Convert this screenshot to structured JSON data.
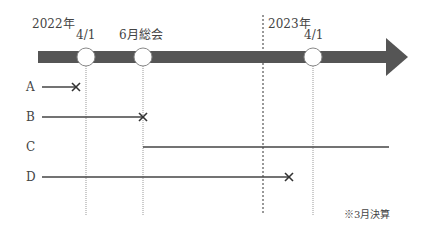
{
  "timeline": {
    "year_start_label": "2022年",
    "year_end_label": "2023年",
    "markers": [
      {
        "label": "4/1",
        "x": 86
      },
      {
        "label": "6月総会",
        "x": 143
      },
      {
        "label": "4/1",
        "x": 313
      }
    ],
    "year_boundary_x": 263,
    "bar_color": "#555555"
  },
  "rows": [
    {
      "label": "A",
      "y": 87,
      "x1": 42,
      "x2": 76,
      "end": "cross"
    },
    {
      "label": "B",
      "y": 117,
      "x1": 42,
      "x2": 143,
      "end": "cross"
    },
    {
      "label": "C",
      "y": 147,
      "x1": 143,
      "x2": 389,
      "end": "none"
    },
    {
      "label": "D",
      "y": 177,
      "x1": 42,
      "x2": 289,
      "end": "cross"
    }
  ],
  "note": "※3月決算"
}
